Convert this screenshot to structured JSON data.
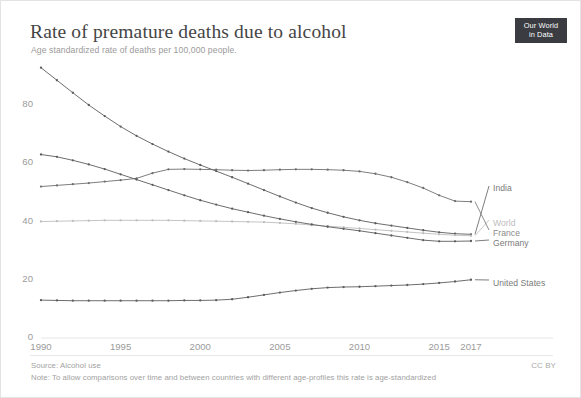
{
  "header": {
    "title": "Rate of premature deaths due to alcohol",
    "subtitle": "Age standardized rate of deaths per 100,000 people.",
    "logo_line1": "Our World",
    "logo_line2": "in Data"
  },
  "footer": {
    "source": "Source: Alcohol use",
    "note": "Note: To allow comparisons over time and between countries with different age-profiles this rate is age-standardized",
    "license": "CC BY"
  },
  "chart_data": {
    "type": "line",
    "title": "Rate of premature deaths due to alcohol",
    "subtitle": "Age standardized rate of deaths per 100,000 people.",
    "xlabel": "",
    "ylabel": "",
    "xlim": [
      1990,
      2017
    ],
    "ylim": [
      0,
      93
    ],
    "grid": false,
    "legend_position": "right-inline",
    "x_ticks": [
      1990,
      1995,
      2000,
      2005,
      2010,
      2015,
      2017
    ],
    "x_tick_labels": [
      "1990",
      "1995",
      "2000",
      "2005",
      "2010",
      "2015",
      "2017"
    ],
    "y_ticks": [
      0,
      20,
      40,
      60,
      80
    ],
    "y_tick_labels": [
      "0",
      "20",
      "40",
      "60",
      "80"
    ],
    "x": [
      1990,
      1991,
      1992,
      1993,
      1994,
      1995,
      1996,
      1997,
      1998,
      1999,
      2000,
      2001,
      2002,
      2003,
      2004,
      2005,
      2006,
      2007,
      2008,
      2009,
      2010,
      2011,
      2012,
      2013,
      2014,
      2015,
      2016,
      2017
    ],
    "series": [
      {
        "name": "India",
        "color": "#5c5c5c",
        "label_color": "#7a7a7a",
        "values": [
          92.8,
          88.5,
          84.2,
          80.0,
          76.2,
          72.6,
          69.4,
          66.6,
          64.0,
          61.6,
          59.4,
          57.3,
          55.2,
          53.0,
          50.8,
          48.6,
          46.5,
          44.6,
          43.0,
          41.6,
          40.4,
          39.4,
          38.6,
          37.8,
          37.0,
          36.3,
          35.8,
          35.6
        ]
      },
      {
        "name": "World",
        "color": "#bdbdbd",
        "label_color": "#bdbdbd",
        "values": [
          40.0,
          40.1,
          40.2,
          40.3,
          40.4,
          40.4,
          40.4,
          40.4,
          40.4,
          40.3,
          40.2,
          40.1,
          40.0,
          39.9,
          39.8,
          39.5,
          39.2,
          38.8,
          38.4,
          38.0,
          37.6,
          37.2,
          36.8,
          36.4,
          36.0,
          35.6,
          35.3,
          35.1
        ]
      },
      {
        "name": "France",
        "color": "#6e6e6e",
        "label_color": "#8a8a8a",
        "values": [
          52.0,
          52.4,
          52.8,
          53.2,
          53.7,
          54.2,
          54.8,
          56.6,
          57.9,
          58.0,
          57.9,
          57.8,
          57.6,
          57.5,
          57.6,
          57.8,
          57.9,
          57.9,
          57.8,
          57.6,
          57.2,
          56.4,
          55.2,
          53.5,
          51.5,
          49.0,
          47.0,
          46.8
        ]
      },
      {
        "name": "Germany",
        "color": "#5c5c5c",
        "label_color": "#7a7a7a",
        "values": [
          63.0,
          62.2,
          61.0,
          59.6,
          58.0,
          56.2,
          54.4,
          52.6,
          50.8,
          49.0,
          47.3,
          45.8,
          44.4,
          43.2,
          42.0,
          40.9,
          39.9,
          39.0,
          38.2,
          37.5,
          36.8,
          36.0,
          35.2,
          34.4,
          33.6,
          33.2,
          33.2,
          33.3
        ]
      },
      {
        "name": "United States",
        "color": "#5c5c5c",
        "label_color": "#7a7a7a",
        "values": [
          13.0,
          12.9,
          12.8,
          12.8,
          12.8,
          12.8,
          12.8,
          12.8,
          12.8,
          12.9,
          12.9,
          13.0,
          13.3,
          14.0,
          14.8,
          15.6,
          16.3,
          16.9,
          17.3,
          17.5,
          17.6,
          17.8,
          18.0,
          18.2,
          18.5,
          18.9,
          19.4,
          20.0
        ]
      }
    ],
    "series_labels": [
      {
        "name": "India",
        "text": "India"
      },
      {
        "name": "World",
        "text": "World"
      },
      {
        "name": "France",
        "text": "France"
      },
      {
        "name": "Germany",
        "text": "Germany"
      },
      {
        "name": "United States",
        "text": "United States"
      }
    ]
  }
}
